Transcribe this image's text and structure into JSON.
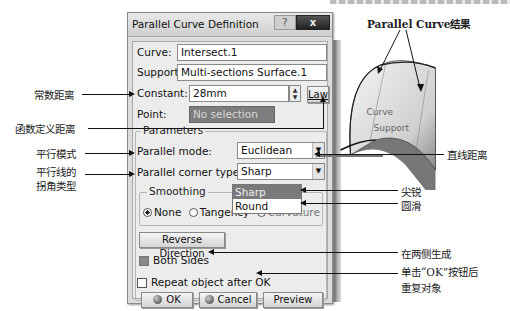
{
  "dialog": {
    "title": "Parallel Curve Definition",
    "help_label": "?",
    "close_label": "x",
    "curve": {
      "label": "Curve:",
      "value": "Intersect.1"
    },
    "support": {
      "label": "Support:",
      "value": "Multi-sections Surface.1"
    },
    "constant": {
      "label": "Constant:",
      "value": "28mm",
      "spin_up": "▲",
      "spin_down": "▼"
    },
    "law_button": "Law",
    "point": {
      "label": "Point:",
      "value": "No selection"
    },
    "parameters": {
      "title": "Parameters",
      "parallel_mode": {
        "label": "Parallel mode:",
        "value": "Euclidean"
      },
      "corner_type": {
        "label": "Parallel corner type:",
        "value": "Sharp",
        "options": [
          "Sharp",
          "Round"
        ],
        "highlighted": "Sharp"
      },
      "arrow_glyph": "▼"
    },
    "smoothing": {
      "title": "Smoothing",
      "options": [
        "None",
        "Tangency",
        "Curvature"
      ],
      "selected": "None"
    },
    "reverse_direction": "Reverse Direction",
    "both_sides": {
      "label": "Both Sides",
      "checked": true
    },
    "repeat_object": {
      "label": "Repeat object after OK",
      "checked": false
    },
    "buttons": {
      "ok": "OK",
      "cancel": "Cancel",
      "preview": "Preview"
    }
  },
  "viewport": {
    "labels": {
      "curve": "Curve",
      "support": "Support"
    }
  },
  "annotations": {
    "result": "Parallel Curve结果",
    "constant_distance": "常数距离",
    "law_distance": "函数定义距离",
    "parallel_mode": "平行模式",
    "corner_type_line1": "平行线的",
    "corner_type_line2": "拐角类型",
    "straight_distance": "直线距离",
    "sharp": "尖锐",
    "round": "圆滑",
    "both_sides": "在两侧生成",
    "repeat_line1": "单击“OK”按钮后",
    "repeat_line2": "重复对象"
  }
}
